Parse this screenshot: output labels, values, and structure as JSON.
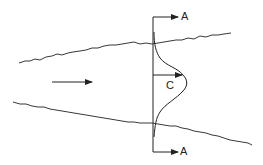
{
  "diagram": {
    "labels": {
      "section_top": "A",
      "section_bottom": "A",
      "centerline_value": "C"
    },
    "elements": [
      "upper-plume-boundary",
      "lower-plume-boundary",
      "flow-direction-arrow",
      "section-line-A-A",
      "gaussian-concentration-profile",
      "centerline-concentration-arrow"
    ],
    "colors": {
      "line": "#222222",
      "background": "#ffffff"
    }
  }
}
